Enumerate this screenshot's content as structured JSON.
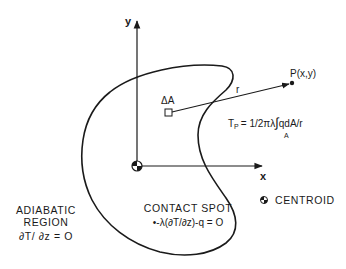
{
  "axes": {
    "x_label": "x",
    "y_label": "y"
  },
  "point": {
    "label": "P(x,y)"
  },
  "element": {
    "label": "ΔA"
  },
  "vector": {
    "label": "r"
  },
  "formula": {
    "lhs": "T",
    "lhs_sub": "P",
    "rhs_pre": "= 1/2πλ",
    "integral": "∫",
    "integral_sub": "A",
    "rhs_post": "qdA/r"
  },
  "adiabatic_region": {
    "line1": "ADIABATIC",
    "line2": "REGION",
    "line3": "∂T/ ∂z = O"
  },
  "contact_spot": {
    "line1": "CONTACT SPOT",
    "line2": "•-λ(∂T/∂z)-q = O"
  },
  "legend": {
    "centroid_label": "CENTROID",
    "centroid_icon": "centroid-symbol"
  },
  "colors": {
    "stroke": "#1a1a1a",
    "background": "#ffffff"
  }
}
